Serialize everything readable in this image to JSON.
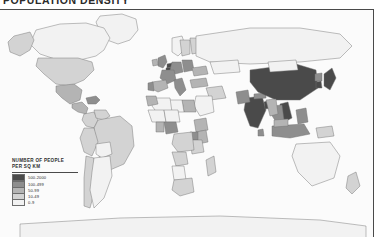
{
  "title": "POPULATION DENSITY",
  "map": {
    "name": "world-population-density-map",
    "projection": "equirectangular",
    "background_color": "#fbfbfb",
    "border_color": "#4a4a4a",
    "country_outline_color": "#6f6f6f"
  },
  "legend": {
    "heading_line1": "NUMBER OF PEOPLE",
    "heading_line2": "PER SQ KM",
    "classes": [
      {
        "label": "500-2000",
        "color": "#4a4a4a"
      },
      {
        "label": "100-499",
        "color": "#8e8e8e"
      },
      {
        "label": "50-99",
        "color": "#b4b4b4"
      },
      {
        "label": "10-49",
        "color": "#d3d3d3"
      },
      {
        "label": "0-9",
        "color": "#f2f2f2"
      }
    ]
  },
  "chart_data": {
    "type": "map",
    "title": "POPULATION DENSITY",
    "legend_title": "NUMBER OF PEOPLE PER SQ KM",
    "unit": "people per square kilometre",
    "classes": [
      "500-2000",
      "100-499",
      "50-99",
      "10-49",
      "0-9"
    ],
    "class_colors": [
      "#4a4a4a",
      "#8e8e8e",
      "#b4b4b4",
      "#d3d3d3",
      "#f2f2f2"
    ],
    "regions": [
      {
        "name": "Greenland",
        "class": "0-9"
      },
      {
        "name": "Canada",
        "class": "0-9"
      },
      {
        "name": "Alaska",
        "class": "10-49"
      },
      {
        "name": "United States",
        "class": "10-49"
      },
      {
        "name": "Mexico",
        "class": "50-99"
      },
      {
        "name": "Central America",
        "class": "50-99"
      },
      {
        "name": "Caribbean",
        "class": "100-499"
      },
      {
        "name": "Colombia",
        "class": "10-49"
      },
      {
        "name": "Venezuela",
        "class": "10-49"
      },
      {
        "name": "Brazil",
        "class": "10-49"
      },
      {
        "name": "Peru",
        "class": "10-49"
      },
      {
        "name": "Bolivia",
        "class": "0-9"
      },
      {
        "name": "Chile",
        "class": "10-49"
      },
      {
        "name": "Argentina",
        "class": "0-9"
      },
      {
        "name": "United Kingdom",
        "class": "100-499"
      },
      {
        "name": "Ireland",
        "class": "50-99"
      },
      {
        "name": "Netherlands",
        "class": "500-2000"
      },
      {
        "name": "Belgium",
        "class": "500-2000"
      },
      {
        "name": "Germany",
        "class": "100-499"
      },
      {
        "name": "France",
        "class": "100-499"
      },
      {
        "name": "Spain",
        "class": "50-99"
      },
      {
        "name": "Portugal",
        "class": "100-499"
      },
      {
        "name": "Italy",
        "class": "100-499"
      },
      {
        "name": "Poland",
        "class": "100-499"
      },
      {
        "name": "Norway",
        "class": "0-9"
      },
      {
        "name": "Sweden",
        "class": "10-49"
      },
      {
        "name": "Finland",
        "class": "10-49"
      },
      {
        "name": "Russia",
        "class": "0-9"
      },
      {
        "name": "Ukraine",
        "class": "50-99"
      },
      {
        "name": "Turkey",
        "class": "50-99"
      },
      {
        "name": "Kazakhstan",
        "class": "0-9"
      },
      {
        "name": "Iran",
        "class": "10-49"
      },
      {
        "name": "Saudi Arabia",
        "class": "0-9"
      },
      {
        "name": "Egypt",
        "class": "50-99"
      },
      {
        "name": "Libya",
        "class": "0-9"
      },
      {
        "name": "Algeria",
        "class": "0-9"
      },
      {
        "name": "Morocco",
        "class": "50-99"
      },
      {
        "name": "Mali",
        "class": "0-9"
      },
      {
        "name": "Niger",
        "class": "0-9"
      },
      {
        "name": "Nigeria",
        "class": "100-499"
      },
      {
        "name": "Ghana",
        "class": "50-99"
      },
      {
        "name": "Ethiopia",
        "class": "50-99"
      },
      {
        "name": "Kenya",
        "class": "50-99"
      },
      {
        "name": "Uganda",
        "class": "100-499"
      },
      {
        "name": "Tanzania",
        "class": "10-49"
      },
      {
        "name": "DR Congo",
        "class": "10-49"
      },
      {
        "name": "Angola",
        "class": "10-49"
      },
      {
        "name": "Namibia",
        "class": "0-9"
      },
      {
        "name": "South Africa",
        "class": "10-49"
      },
      {
        "name": "Madagascar",
        "class": "10-49"
      },
      {
        "name": "India",
        "class": "500-2000"
      },
      {
        "name": "Pakistan",
        "class": "100-499"
      },
      {
        "name": "Bangladesh",
        "class": "500-2000"
      },
      {
        "name": "Sri Lanka",
        "class": "100-499"
      },
      {
        "name": "Nepal",
        "class": "100-499"
      },
      {
        "name": "China",
        "class": "500-2000"
      },
      {
        "name": "Mongolia",
        "class": "0-9"
      },
      {
        "name": "Japan",
        "class": "500-2000"
      },
      {
        "name": "South Korea",
        "class": "500-2000"
      },
      {
        "name": "North Korea",
        "class": "100-499"
      },
      {
        "name": "Vietnam",
        "class": "500-2000"
      },
      {
        "name": "Thailand",
        "class": "100-499"
      },
      {
        "name": "Myanmar",
        "class": "50-99"
      },
      {
        "name": "Philippines",
        "class": "100-499"
      },
      {
        "name": "Indonesia",
        "class": "100-499"
      },
      {
        "name": "Malaysia",
        "class": "50-99"
      },
      {
        "name": "Papua New Guinea",
        "class": "10-49"
      },
      {
        "name": "Australia",
        "class": "0-9"
      },
      {
        "name": "New Zealand",
        "class": "10-49"
      },
      {
        "name": "Antarctica",
        "class": "0-9"
      }
    ]
  }
}
